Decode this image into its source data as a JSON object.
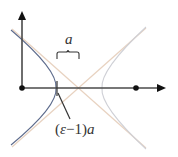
{
  "diagram": {
    "type": "hyperbola-geometry",
    "labels": {
      "a": "a",
      "eps_open": "(",
      "eps_symbol": "ε",
      "eps_minus": "−1",
      "eps_close": ")",
      "eps_a": "a"
    },
    "colors": {
      "axis": "#4a4a4a",
      "left_branch": "#5a6a8a",
      "right_branch": "#c8c8cc",
      "asymptote": "#e6cdb8",
      "pointer": "#333333",
      "dot": "#111111"
    },
    "points": [
      {
        "name": "origin",
        "x": 22,
        "y": 88
      },
      {
        "name": "focus",
        "x": 136,
        "y": 88
      }
    ]
  }
}
